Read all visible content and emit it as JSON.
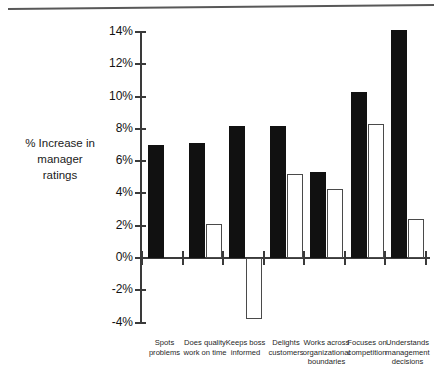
{
  "chart_data": {
    "type": "bar",
    "title": "",
    "subtitle": "",
    "xlabel": "",
    "ylabel": "% Increase in manager ratings",
    "ylabel_lines": [
      "% Increase in",
      "manager",
      "ratings"
    ],
    "categories": [
      "Spots problems",
      "Does quality work on time",
      "Keeps boss informed",
      "Delights customers",
      "Works across organizational boundaries",
      "Focuses on competition",
      "Understands management decisions"
    ],
    "category_label_lines": [
      [
        "Spots",
        "problems"
      ],
      [
        "Does quality",
        "work on time"
      ],
      [
        "Keeps boss",
        "informed"
      ],
      [
        "Delights",
        "customers"
      ],
      [
        "Works across",
        "organizational",
        "boundaries"
      ],
      [
        "Focuses on",
        "competition"
      ],
      [
        "Understands",
        "management",
        "decisions"
      ]
    ],
    "series": [
      {
        "name": "black",
        "fill": "#111111",
        "values": [
          7.0,
          7.1,
          8.2,
          8.2,
          5.3,
          10.3,
          14.1
        ]
      },
      {
        "name": "white",
        "fill": "#ffffff",
        "values": [
          null,
          2.1,
          -3.8,
          5.2,
          4.3,
          8.3,
          2.4
        ]
      }
    ],
    "ylim": [
      -4,
      14
    ],
    "ytick_values": [
      -4,
      -2,
      0,
      2,
      4,
      6,
      8,
      10,
      12,
      14
    ],
    "ytick_labels": [
      "-4%",
      "-2%",
      "0%",
      "2%",
      "4%",
      "6%",
      "8%",
      "10%",
      "12%",
      "14%"
    ],
    "grid": false,
    "legend": "none",
    "zero_baseline": true
  }
}
